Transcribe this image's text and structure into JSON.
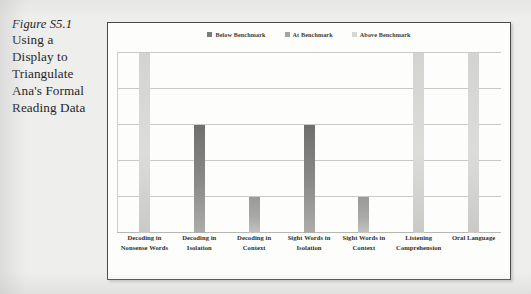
{
  "figure": {
    "caption_lines": [
      "Figure S5.1",
      "Using a",
      "Display to",
      "Triangulate",
      "Ana's Formal",
      "Reading Data"
    ]
  },
  "colors": {
    "below_benchmark": "#7b7b78",
    "at_benchmark": "#a3a3a0",
    "above_benchmark": "#d6d6d3",
    "gridline": "#c9c9c6",
    "frame_border": "#4a4a46",
    "plot_background": "#fdfdfc",
    "page_background": "#eeeeed",
    "text": "#26251f"
  },
  "chart_data": {
    "type": "bar",
    "title": "",
    "xlabel": "",
    "ylabel": "",
    "grid": true,
    "legend_position": "top-center",
    "ylim": [
      0,
      5
    ],
    "gridline_count": 5,
    "categories": [
      "Decoding in Nonsense Words",
      "Decoding in Isolation",
      "Decoding in Context",
      "Sight Words in Isolation",
      "Sight Words in Context",
      "Listening Comprehension",
      "Oral Language"
    ],
    "legend": [
      {
        "label": "Below Benchmark",
        "color": "#7b7b78",
        "key": "below"
      },
      {
        "label": "At Benchmark",
        "color": "#a3a3a0",
        "key": "at"
      },
      {
        "label": "Above Benchmark",
        "color": "#d6d6d3",
        "key": "above"
      }
    ],
    "bars": [
      {
        "category": "Decoding in Nonsense Words",
        "value": 5,
        "series": "Above Benchmark",
        "style": "above"
      },
      {
        "category": "Decoding in Isolation",
        "value": 3,
        "series": "Below Benchmark",
        "style": "below"
      },
      {
        "category": "Decoding in Context",
        "value": 1,
        "series": "At Benchmark",
        "style": "at"
      },
      {
        "category": "Sight Words in Isolation",
        "value": 3,
        "series": "Below Benchmark",
        "style": "below"
      },
      {
        "category": "Sight Words in Context",
        "value": 1,
        "series": "At Benchmark",
        "style": "at"
      },
      {
        "category": "Listening Comprehension",
        "value": 5,
        "series": "Above Benchmark",
        "style": "above"
      },
      {
        "category": "Oral Language",
        "value": 5,
        "series": "Above Benchmark",
        "style": "above"
      }
    ],
    "values": [
      5,
      3,
      1,
      3,
      1,
      5,
      5
    ],
    "x_tick_labels": [
      [
        "Decoding in",
        "Nonsense Words"
      ],
      [
        "Decoding in",
        "Isolation"
      ],
      [
        "Decoding in",
        "Context"
      ],
      [
        "Sight Words in",
        "Isolation"
      ],
      [
        "Sight Words in",
        "Context"
      ],
      [
        "Listening",
        "Comprehension"
      ],
      [
        "Oral Language",
        ""
      ]
    ]
  }
}
